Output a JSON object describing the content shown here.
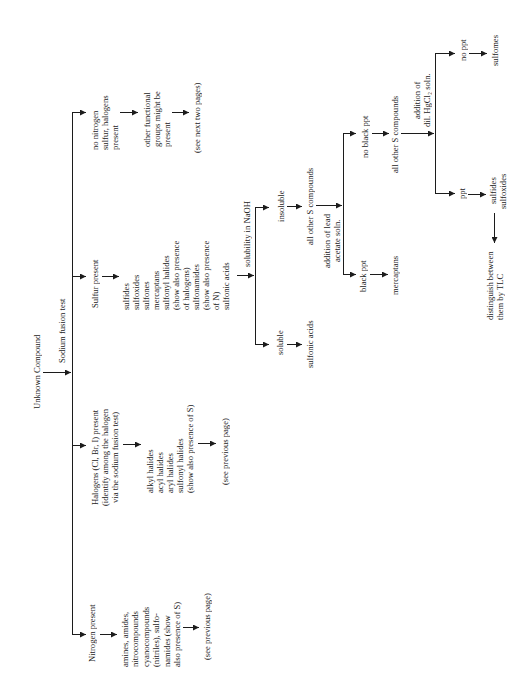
{
  "colors": {
    "ink": "#1c1c1c",
    "background": "#ffffff"
  },
  "root": {
    "label": "Unknown Compound",
    "test": "Sodium fusion test"
  },
  "no_element_branch": {
    "condition": [
      "no nitrogen",
      "sulfur, halogens",
      "present"
    ],
    "result": [
      "other functional",
      "groups might be",
      "present"
    ],
    "reference": "(see next two pages)"
  },
  "sulfur_branch": {
    "condition": "Sulfur present",
    "compounds": [
      "sulfides",
      "sulfoxides",
      "sulfones",
      "mercaptans",
      "sulfonyl halides",
      "(show also presence",
      "of halogens)",
      "sulfonamides",
      "(show also presence",
      "of N)",
      "sulfonic acids"
    ],
    "test": "solubility in NaOH",
    "soluble": {
      "label": "soluble",
      "result": "sulfonic acids"
    },
    "insoluble": {
      "label": "insoluble",
      "result": "all other S compounds",
      "test": [
        "addition of lead",
        "acetate soln."
      ],
      "black_ppt": {
        "label": "black ppt",
        "result": "mercaptans"
      },
      "no_black_ppt": {
        "label": "no black ppt",
        "result": "all other S compounds",
        "test": [
          "addition of",
          "dil. HgCl₂ soln."
        ],
        "ppt": {
          "label": "ppt",
          "result": [
            "sulfides",
            "sulfoxides"
          ],
          "note": [
            "distinguish between",
            "them by TLC"
          ]
        },
        "no_ppt": {
          "label": "no ppt",
          "result": "sulfomes"
        }
      }
    }
  },
  "halogen_branch": {
    "condition": [
      "Halogens (Cl, Br, I) present",
      "(identify among the halogen",
      "via the sodium fusion test)"
    ],
    "compounds": [
      "alkyl halides",
      "acyl halides",
      "aryl halides",
      "sulfonyl halides",
      "(show also presence of S)"
    ],
    "reference": "(see previous page)"
  },
  "nitrogen_branch": {
    "condition": "Nitrogen present",
    "compounds": [
      "amines, amides,",
      "nitrocompounds",
      "cyanocompounds",
      "(nitriles), sulfo-",
      "namides (show",
      "also presence of S)"
    ],
    "reference": "(see previous page)"
  }
}
